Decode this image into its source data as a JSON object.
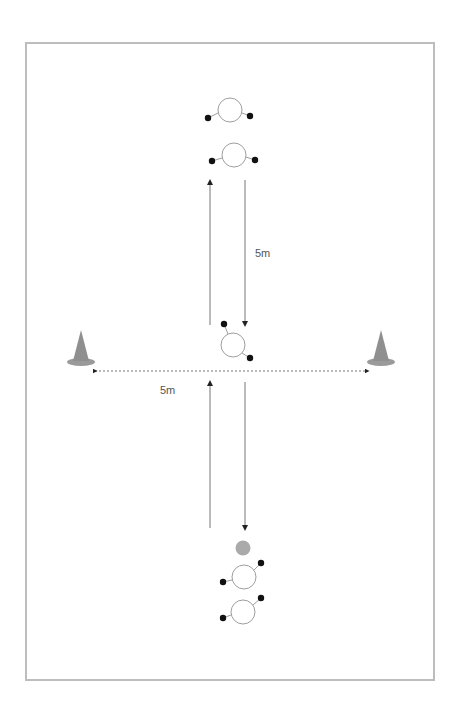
{
  "diagram": {
    "type": "drill-diagram",
    "frame": {
      "border_color": "#bdbdbd"
    },
    "labels": {
      "vertical_distance": "5m",
      "horizontal_distance": "5m"
    },
    "colors": {
      "player_outline": "#9e9e9e",
      "hand_dot": "#111111",
      "cone": "#9a9a9a",
      "ball": "#aaaaaa",
      "arrow": "#777777"
    },
    "elements": {
      "players_top": 2,
      "players_center": 1,
      "players_bottom": 2,
      "cones": 2,
      "balls": 1
    }
  }
}
